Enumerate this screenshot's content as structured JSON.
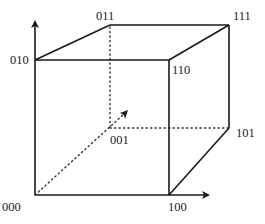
{
  "diagram": {
    "type": "boolean-cube",
    "vertices": [
      {
        "id": "v000",
        "label": "000",
        "x": 35,
        "y": 195
      },
      {
        "id": "v100",
        "label": "100",
        "x": 169,
        "y": 195
      },
      {
        "id": "v010",
        "label": "010",
        "x": 35,
        "y": 60
      },
      {
        "id": "v110",
        "label": "110",
        "x": 169,
        "y": 60
      },
      {
        "id": "v001",
        "label": "001",
        "x": 110,
        "y": 128
      },
      {
        "id": "v101",
        "label": "101",
        "x": 229,
        "y": 128
      },
      {
        "id": "v011",
        "label": "011",
        "x": 110,
        "y": 25
      },
      {
        "id": "v111",
        "label": "111",
        "x": 229,
        "y": 25
      }
    ],
    "labels": {
      "l000": "000",
      "l100": "100",
      "l010": "010",
      "l110": "110",
      "l001": "001",
      "l101": "101",
      "l011": "011",
      "l111": "111"
    },
    "axes": [
      {
        "name": "x-axis",
        "from": "000",
        "to": "100",
        "arrow": true
      },
      {
        "name": "y-axis",
        "from": "000",
        "to": "010",
        "arrow": true
      },
      {
        "name": "z-axis",
        "from": "000",
        "to": "001",
        "arrow": true,
        "style": "dotted"
      }
    ],
    "colors": {
      "stroke": "#1a1a1a",
      "background": "#ffffff"
    }
  }
}
